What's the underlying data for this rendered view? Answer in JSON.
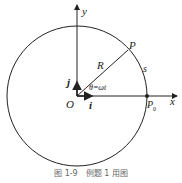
{
  "diagram": {
    "labels": {
      "y_axis": "y",
      "x_axis": "x",
      "point_p": "P",
      "radius": "R",
      "arc": "s",
      "unit_j": "j",
      "unit_i": "i",
      "origin": "O",
      "angle": "θ=ωt",
      "p0_main": "P",
      "p0_sub": "0"
    },
    "caption": "图 1-9　例题 1 用图",
    "colors": {
      "stroke": "#222222",
      "caption": "#666666"
    }
  }
}
